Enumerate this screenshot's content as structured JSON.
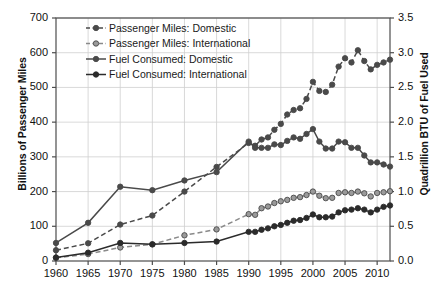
{
  "chart_data": {
    "type": "line",
    "title": "",
    "xlabel": "",
    "ylabel": "Billions of Passenger Miles",
    "ylabel_right": "Quadrillion BTU of Fuel Used",
    "xlim": [
      1960,
      2012
    ],
    "ylim": [
      0,
      700
    ],
    "ylim_right": [
      0.0,
      3.5
    ],
    "yticks": [
      0,
      100,
      200,
      300,
      400,
      500,
      600,
      700
    ],
    "yticks_right": [
      "0.0",
      "0.5",
      "1.0",
      "1.5",
      "2.0",
      "2.5",
      "3.0",
      "3.5"
    ],
    "xticks": [
      1960,
      1965,
      1970,
      1975,
      1980,
      1985,
      1990,
      1995,
      2000,
      2005,
      2010
    ],
    "grid": true,
    "legend_position": "top-left",
    "series": [
      {
        "name": "Passenger Miles: Domestic",
        "axis": "left",
        "style": "dashed",
        "marker": "filled-circle",
        "color": "#4a4a4a",
        "x": [
          1960,
          1965,
          1970,
          1975,
          1980,
          1985,
          1990,
          1991,
          1992,
          1993,
          1994,
          1995,
          1996,
          1997,
          1998,
          1999,
          2000,
          2001,
          2002,
          2003,
          2004,
          2005,
          2006,
          2007,
          2008,
          2009,
          2010,
          2011,
          2012
        ],
        "y": [
          31,
          51,
          105,
          131,
          200,
          271,
          340,
          332,
          350,
          356,
          378,
          395,
          422,
          435,
          440,
          467,
          516,
          490,
          487,
          508,
          560,
          584,
          572,
          607,
          576,
          552,
          565,
          572,
          580
        ]
      },
      {
        "name": "Passenger Miles: International",
        "axis": "left",
        "style": "dashed",
        "marker": "open-circle",
        "color": "#8a8a8a",
        "x": [
          1960,
          1965,
          1970,
          1975,
          1980,
          1985,
          1990,
          1991,
          1992,
          1993,
          1994,
          1995,
          1996,
          1997,
          1998,
          1999,
          2000,
          2001,
          2002,
          2003,
          2004,
          2005,
          2006,
          2007,
          2008,
          2009,
          2010,
          2011,
          2012
        ],
        "y": [
          9,
          20,
          39,
          48,
          74,
          91,
          135,
          133,
          152,
          157,
          167,
          172,
          176,
          182,
          184,
          190,
          200,
          188,
          181,
          182,
          196,
          198,
          196,
          200,
          195,
          186,
          196,
          198,
          201
        ]
      },
      {
        "name": "Fuel Consumed: Domestic",
        "axis": "right",
        "style": "solid",
        "marker": "filled-circle",
        "color": "#4a4a4a",
        "x": [
          1960,
          1965,
          1970,
          1975,
          1980,
          1985,
          1990,
          1991,
          1992,
          1993,
          1994,
          1995,
          1996,
          1997,
          1998,
          1999,
          2000,
          2001,
          2002,
          2003,
          2004,
          2005,
          2006,
          2007,
          2008,
          2009,
          2010,
          2011,
          2012
        ],
        "y": [
          0.26,
          0.55,
          1.07,
          1.02,
          1.16,
          1.28,
          1.72,
          1.63,
          1.63,
          1.63,
          1.68,
          1.67,
          1.73,
          1.78,
          1.76,
          1.83,
          1.9,
          1.72,
          1.62,
          1.62,
          1.72,
          1.71,
          1.63,
          1.63,
          1.52,
          1.42,
          1.42,
          1.39,
          1.36
        ]
      },
      {
        "name": "Fuel Consumed: International",
        "axis": "right",
        "style": "solid",
        "marker": "filled-circle",
        "color": "#2b2b2b",
        "x": [
          1960,
          1965,
          1970,
          1975,
          1980,
          1985,
          1990,
          1991,
          1992,
          1993,
          1994,
          1995,
          1996,
          1997,
          1998,
          1999,
          2000,
          2001,
          2002,
          2003,
          2004,
          2005,
          2006,
          2007,
          2008,
          2009,
          2010,
          2011,
          2012
        ],
        "y": [
          0.05,
          0.12,
          0.26,
          0.24,
          0.26,
          0.28,
          0.42,
          0.42,
          0.45,
          0.47,
          0.5,
          0.52,
          0.55,
          0.58,
          0.59,
          0.62,
          0.67,
          0.63,
          0.63,
          0.64,
          0.7,
          0.73,
          0.74,
          0.76,
          0.74,
          0.7,
          0.74,
          0.78,
          0.8
        ]
      }
    ],
    "legend": [
      "Passenger Miles: Domestic",
      "Passenger Miles: International",
      "Fuel Consumed: Domestic",
      "Fuel Consumed: International"
    ]
  }
}
